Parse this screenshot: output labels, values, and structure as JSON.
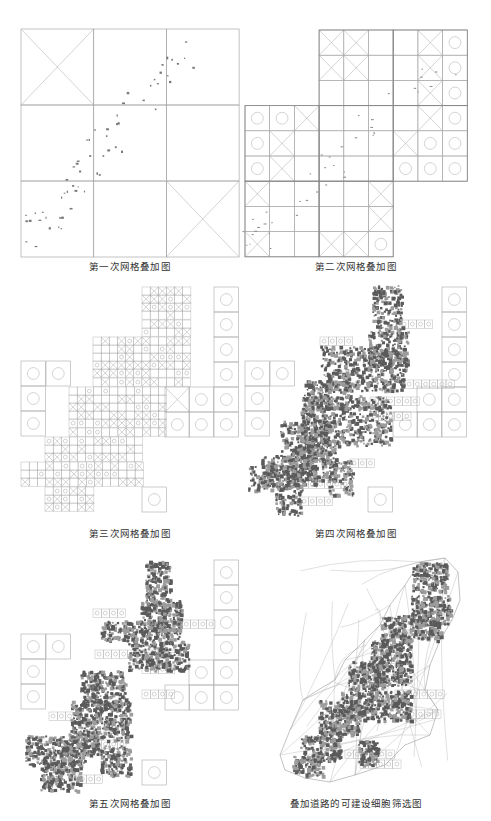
{
  "figure": {
    "panels": [
      {
        "id": "grid-1",
        "caption": "第一次网格叠加图",
        "caption_pos": [
          130,
          265
        ],
        "cell_size": [
          72.7,
          76
        ],
        "origin": [
          21,
          29
        ],
        "cells": [
          [
            0,
            0,
            "x"
          ],
          [
            1,
            0,
            ""
          ],
          [
            2,
            0,
            ""
          ],
          [
            0,
            1,
            ""
          ],
          [
            1,
            1,
            ""
          ],
          [
            2,
            1,
            ""
          ],
          [
            0,
            2,
            ""
          ],
          [
            1,
            2,
            ""
          ],
          [
            2,
            2,
            "x"
          ]
        ]
      },
      {
        "id": "grid-2",
        "caption": "第二次网格叠加图",
        "caption_pos": [
          356,
          265
        ],
        "cell_size": [
          24.7,
          25.2
        ],
        "origin": [
          245,
          30
        ],
        "cells": [
          [
            3,
            0,
            "x"
          ],
          [
            4,
            0,
            "x"
          ],
          [
            5,
            0,
            ""
          ],
          [
            6,
            0,
            ""
          ],
          [
            7,
            0,
            "x"
          ],
          [
            8,
            0,
            "o"
          ],
          [
            3,
            1,
            "x"
          ],
          [
            4,
            1,
            "x"
          ],
          [
            5,
            1,
            ""
          ],
          [
            6,
            1,
            ""
          ],
          [
            7,
            1,
            "x"
          ],
          [
            8,
            1,
            "o"
          ],
          [
            3,
            2,
            ""
          ],
          [
            4,
            2,
            ""
          ],
          [
            5,
            2,
            ""
          ],
          [
            6,
            2,
            ""
          ],
          [
            7,
            2,
            "x"
          ],
          [
            8,
            2,
            "o"
          ],
          [
            0,
            3,
            "o"
          ],
          [
            1,
            3,
            "o"
          ],
          [
            2,
            3,
            "x"
          ],
          [
            3,
            3,
            ""
          ],
          [
            4,
            3,
            ""
          ],
          [
            5,
            3,
            ""
          ],
          [
            6,
            3,
            ""
          ],
          [
            7,
            3,
            "x"
          ],
          [
            8,
            3,
            "o"
          ],
          [
            0,
            4,
            "o"
          ],
          [
            1,
            4,
            "x"
          ],
          [
            2,
            4,
            ""
          ],
          [
            3,
            4,
            ""
          ],
          [
            4,
            4,
            ""
          ],
          [
            5,
            4,
            ""
          ],
          [
            6,
            4,
            "x"
          ],
          [
            7,
            4,
            "o"
          ],
          [
            8,
            4,
            "o"
          ],
          [
            0,
            5,
            "o"
          ],
          [
            1,
            5,
            "x"
          ],
          [
            2,
            5,
            ""
          ],
          [
            3,
            5,
            ""
          ],
          [
            4,
            5,
            ""
          ],
          [
            5,
            5,
            ""
          ],
          [
            6,
            5,
            "o"
          ],
          [
            7,
            5,
            "o"
          ],
          [
            8,
            5,
            "o"
          ],
          [
            0,
            6,
            "x"
          ],
          [
            1,
            6,
            ""
          ],
          [
            2,
            6,
            ""
          ],
          [
            3,
            6,
            ""
          ],
          [
            4,
            6,
            ""
          ],
          [
            5,
            6,
            "x"
          ],
          [
            0,
            7,
            ""
          ],
          [
            1,
            7,
            ""
          ],
          [
            2,
            7,
            ""
          ],
          [
            3,
            7,
            ""
          ],
          [
            4,
            7,
            ""
          ],
          [
            5,
            7,
            "x"
          ],
          [
            0,
            8,
            "x"
          ],
          [
            1,
            8,
            ""
          ],
          [
            2,
            8,
            ""
          ],
          [
            3,
            8,
            "x"
          ],
          [
            4,
            8,
            "x"
          ],
          [
            5,
            8,
            "o"
          ]
        ]
      },
      {
        "id": "grid-3",
        "caption": "第三次网格叠加图",
        "caption_pos": [
          130,
          532
        ],
        "big_cells": [
          [
            214,
            287,
            "o"
          ],
          [
            214,
            312,
            "o"
          ],
          [
            214,
            337,
            "o"
          ],
          [
            214,
            362,
            "o"
          ],
          [
            214,
            387,
            "o"
          ],
          [
            214,
            412,
            "o"
          ],
          [
            189,
            387,
            "o"
          ],
          [
            165,
            387,
            "x"
          ],
          [
            189,
            412,
            "o"
          ],
          [
            165,
            412,
            "o"
          ],
          [
            21,
            361,
            "o"
          ],
          [
            46,
            361,
            "o"
          ],
          [
            21,
            386,
            "o"
          ],
          [
            21,
            411,
            "o"
          ],
          [
            142,
            487,
            "o"
          ]
        ],
        "fine_region": {
          "cell": 8.15,
          "rows": [
            [
              142,
              287,
              6
            ],
            [
              142,
              295,
              6
            ],
            [
              142,
              303,
              6
            ],
            [
              142,
              311,
              6
            ],
            [
              142,
              320,
              6
            ],
            [
              142,
              328,
              6
            ],
            [
              93,
              337,
              12
            ],
            [
              93,
              345,
              12
            ],
            [
              93,
              353,
              12
            ],
            [
              93,
              361,
              12
            ],
            [
              93,
              369,
              12
            ],
            [
              93,
              378,
              12
            ],
            [
              69,
              387,
              12
            ],
            [
              69,
              395,
              12
            ],
            [
              69,
              403,
              12
            ],
            [
              69,
              411,
              12
            ],
            [
              69,
              419,
              12
            ],
            [
              69,
              428,
              12
            ],
            [
              45,
              437,
              12
            ],
            [
              45,
              445,
              12
            ],
            [
              45,
              453,
              12
            ],
            [
              21,
              462,
              15
            ],
            [
              21,
              470,
              15
            ],
            [
              21,
              478,
              15
            ],
            [
              45,
              487,
              6
            ],
            [
              45,
              495,
              6
            ],
            [
              45,
              503,
              6
            ]
          ]
        }
      },
      {
        "id": "grid-4",
        "caption": "第四次网格叠加图",
        "caption_pos": [
          356,
          532
        ],
        "big_cells": [
          [
            442,
            287,
            "o"
          ],
          [
            442,
            312,
            "o"
          ],
          [
            442,
            337,
            "o"
          ],
          [
            442,
            362,
            "o"
          ],
          [
            442,
            387,
            "o"
          ],
          [
            442,
            412,
            "o"
          ],
          [
            417,
            387,
            "o"
          ],
          [
            417,
            412,
            "o"
          ],
          [
            393,
            412,
            "o"
          ],
          [
            245,
            361,
            "o"
          ],
          [
            270,
            361,
            "o"
          ],
          [
            245,
            386,
            "o"
          ],
          [
            245,
            411,
            "o"
          ],
          [
            368,
            487,
            "o"
          ]
        ],
        "dense_blobs": [
          [
            372,
            285,
            30,
            45
          ],
          [
            368,
            330,
            40,
            35
          ],
          [
            320,
            345,
            85,
            45
          ],
          [
            304,
            380,
            45,
            25
          ],
          [
            300,
            395,
            90,
            50
          ],
          [
            280,
            420,
            50,
            40
          ],
          [
            290,
            440,
            45,
            40
          ],
          [
            260,
            455,
            55,
            30
          ],
          [
            248,
            465,
            55,
            25
          ],
          [
            275,
            485,
            25,
            30
          ],
          [
            328,
            460,
            25,
            35
          ]
        ],
        "light_cells": [
          [
            320,
            337,
            4,
            "o"
          ],
          [
            400,
            320,
            4,
            "o"
          ],
          [
            405,
            380,
            6,
            "o"
          ],
          [
            370,
            397,
            6,
            "o"
          ],
          [
            370,
            412,
            5,
            "o"
          ],
          [
            300,
            480,
            6,
            "o"
          ],
          [
            300,
            497,
            4,
            "o"
          ],
          [
            350,
            459,
            3,
            "o"
          ]
        ]
      },
      {
        "id": "grid-5",
        "caption": "第五次网格叠加图",
        "caption_pos": [
          130,
          802
        ],
        "big_cells": [
          [
            214,
            560,
            "o"
          ],
          [
            214,
            585,
            "o"
          ],
          [
            214,
            610,
            "o"
          ],
          [
            214,
            635,
            "o"
          ],
          [
            214,
            660,
            "o"
          ],
          [
            214,
            685,
            "o"
          ],
          [
            189,
            660,
            "o"
          ],
          [
            189,
            685,
            "o"
          ],
          [
            165,
            685,
            "o"
          ],
          [
            21,
            634,
            "o"
          ],
          [
            46,
            634,
            "o"
          ],
          [
            21,
            659,
            "o"
          ],
          [
            21,
            684,
            "o"
          ],
          [
            142,
            760,
            "o"
          ]
        ],
        "dense_blobs": [
          [
            145,
            560,
            25,
            50
          ],
          [
            140,
            600,
            40,
            30
          ],
          [
            100,
            620,
            80,
            20
          ],
          [
            128,
            640,
            60,
            30
          ],
          [
            80,
            670,
            45,
            35
          ],
          [
            70,
            700,
            60,
            40
          ],
          [
            68,
            730,
            30,
            25
          ],
          [
            25,
            735,
            60,
            30
          ],
          [
            40,
            760,
            40,
            30
          ],
          [
            100,
            745,
            30,
            30
          ]
        ],
        "light_cells": [
          [
            93,
            609,
            4,
            "o"
          ],
          [
            174,
            620,
            5,
            "o"
          ],
          [
            95,
            650,
            10,
            "o"
          ],
          [
            142,
            665,
            4,
            "o"
          ],
          [
            142,
            690,
            4,
            "o"
          ],
          [
            49,
            712,
            3,
            "o"
          ],
          [
            85,
            740,
            5,
            "o"
          ],
          [
            70,
            775,
            4,
            "o"
          ]
        ]
      },
      {
        "id": "road-overlay",
        "caption": "叠加道路的可建设细胞筛选图",
        "caption_pos": [
          356,
          802
        ],
        "outline": [
          [
            420,
            562
          ],
          [
            445,
            558
          ],
          [
            458,
            572
          ],
          [
            460,
            600
          ],
          [
            452,
            620
          ],
          [
            440,
            640
          ],
          [
            430,
            665
          ],
          [
            425,
            690
          ],
          [
            438,
            710
          ],
          [
            430,
            735
          ],
          [
            405,
            745
          ],
          [
            385,
            765
          ],
          [
            355,
            775
          ],
          [
            330,
            782
          ],
          [
            305,
            778
          ],
          [
            285,
            770
          ],
          [
            280,
            755
          ],
          [
            290,
            730
          ],
          [
            303,
            700
          ],
          [
            318,
            690
          ],
          [
            335,
            680
          ],
          [
            345,
            660
          ],
          [
            365,
            640
          ],
          [
            380,
            625
          ],
          [
            390,
            605
          ],
          [
            405,
            585
          ],
          [
            420,
            562
          ]
        ],
        "dense_blobs": [
          [
            412,
            562,
            35,
            30
          ],
          [
            410,
            595,
            40,
            30
          ],
          [
            380,
            615,
            60,
            25
          ],
          [
            370,
            640,
            40,
            45
          ],
          [
            348,
            660,
            35,
            30
          ],
          [
            340,
            690,
            40,
            30
          ],
          [
            318,
            700,
            40,
            35
          ],
          [
            300,
            735,
            40,
            25
          ],
          [
            292,
            755,
            30,
            20
          ],
          [
            380,
            690,
            30,
            30
          ],
          [
            358,
            740,
            20,
            25
          ]
        ],
        "light_cells": [
          [
            390,
            630,
            4,
            "o"
          ],
          [
            375,
            655,
            3,
            "o"
          ],
          [
            395,
            690,
            6,
            "o"
          ],
          [
            400,
            710,
            5,
            "o"
          ],
          [
            320,
            715,
            3,
            "o"
          ],
          [
            345,
            750,
            6,
            "o"
          ],
          [
            360,
            760,
            5,
            "o"
          ]
        ]
      }
    ]
  },
  "colors": {
    "grid_line": "#a9a9a9",
    "thick_line": "#8a8a8a",
    "dense_fill": "#5a5a5a",
    "outline": "#9a9a9a",
    "caption": "#333333"
  }
}
